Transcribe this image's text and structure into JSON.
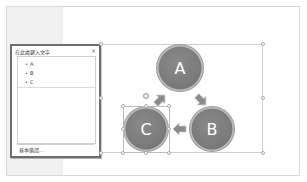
{
  "text_pane": {
    "title": "在此處鍵入文字",
    "close_label": "×",
    "items": [
      {
        "bullet": "•",
        "label": "A"
      },
      {
        "bullet": "•",
        "label": "B"
      },
      {
        "bullet": "•",
        "label": "C"
      }
    ],
    "footer": "基本循環..."
  },
  "diagram": {
    "type": "basic-cycle",
    "nodes": [
      {
        "label": "A"
      },
      {
        "label": "B"
      },
      {
        "label": "C"
      }
    ],
    "selected_node": "C",
    "colors": {
      "node_fill": "#7a7a7a",
      "node_text": "#ffffff",
      "arrow_fill": "#8a8a8a"
    }
  }
}
